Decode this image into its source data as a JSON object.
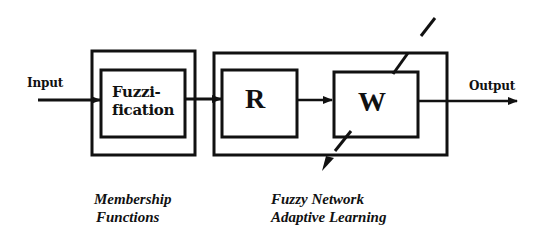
{
  "diagram": {
    "input_label": "Input",
    "output_label": "Output",
    "blocks": {
      "fuzzification": {
        "line1": "Fuzzi-",
        "line2": "fication"
      },
      "r": {
        "label": "R"
      },
      "w": {
        "label": "W"
      }
    },
    "captions": {
      "membership": {
        "line1": "Membership",
        "line2": "Functions"
      },
      "network": {
        "line1": "Fuzzy Network",
        "line2": "Adaptive Learning"
      }
    },
    "colors": {
      "line": "#111111",
      "background": "#ffffff"
    }
  }
}
